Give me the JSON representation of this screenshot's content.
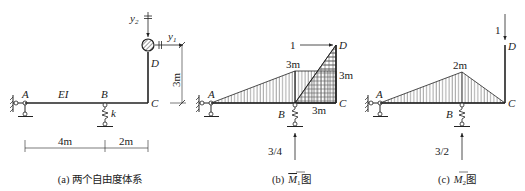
{
  "panels": {
    "a": {
      "caption": "(a) 两个自由度体系",
      "labels": {
        "A": "A",
        "B": "B",
        "C": "C",
        "D": "D",
        "EI": "EI",
        "k": "k",
        "y1": "y",
        "y1_sub": "1",
        "y2": "y",
        "y2_sub": "2"
      },
      "dims": {
        "AB": "4m",
        "BC": "2m",
        "CD": "3m"
      }
    },
    "b": {
      "caption_prefix": "(b)",
      "caption_symbol": "M",
      "caption_sub": "1",
      "caption_suffix": "图",
      "labels": {
        "A": "A",
        "B": "B",
        "C": "C",
        "D": "D"
      },
      "load": "1",
      "values": {
        "B_top": "3m",
        "C_side": "3m",
        "C_bottom": "3m"
      },
      "reaction": "3/4"
    },
    "c": {
      "caption_prefix": "(c)",
      "caption_symbol": "M",
      "caption_sub": "2",
      "caption_suffix": "图",
      "labels": {
        "A": "A",
        "B": "B",
        "C": "C",
        "D": "D"
      },
      "load": "1",
      "values": {
        "B_peak": "2m"
      },
      "reaction": "3/2"
    }
  },
  "colors": {
    "line": "#222222",
    "hatch": "#444444",
    "mass": "#555555"
  }
}
